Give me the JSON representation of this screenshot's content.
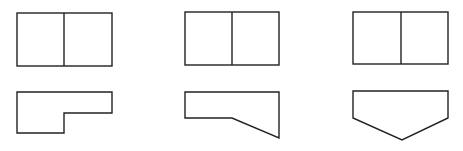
{
  "diagram": {
    "type": "orthographic-views",
    "stroke_color": "#222222",
    "background": "#ffffff",
    "figures": [
      {
        "id": "figure-1",
        "top_view": {
          "rect": {
            "x": 17,
            "y": 13,
            "w": 95,
            "h": 53
          },
          "divider_x": 64
        },
        "front_view": {
          "shape": "stepped-l",
          "points": [
            [
              17,
              92
            ],
            [
              112,
              92
            ],
            [
              112,
              113
            ],
            [
              64,
              113
            ],
            [
              64,
              133
            ],
            [
              17,
              133
            ]
          ]
        }
      },
      {
        "id": "figure-2",
        "top_view": {
          "rect": {
            "x": 185,
            "y": 12,
            "w": 94,
            "h": 53
          },
          "divider_x": 232
        },
        "front_view": {
          "shape": "slanted-bottom",
          "points": [
            [
              185,
              92
            ],
            [
              279,
              92
            ],
            [
              279,
              138
            ],
            [
              232,
              118
            ],
            [
              185,
              118
            ]
          ]
        }
      },
      {
        "id": "figure-3",
        "top_view": {
          "rect": {
            "x": 353,
            "y": 12,
            "w": 95,
            "h": 52
          },
          "divider_x": 401
        },
        "front_view": {
          "shape": "pentagon-point-down",
          "points": [
            [
              353,
              91
            ],
            [
              448,
              91
            ],
            [
              448,
              118
            ],
            [
              402,
              140
            ],
            [
              353,
              118
            ]
          ]
        }
      }
    ]
  }
}
